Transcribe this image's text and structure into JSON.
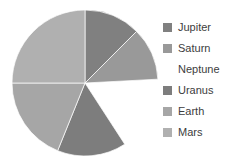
{
  "chart_data": {
    "type": "pie",
    "title": "",
    "categories": [
      "Jupiter",
      "Saturn",
      "Neptune",
      "Uranus",
      "Earth",
      "Mars"
    ],
    "values": [
      12.5,
      11.7,
      16.7,
      15.3,
      18.9,
      25.0
    ],
    "units": "percent",
    "start_angle_deg": 0,
    "direction": "clockwise",
    "exploded_slices": [
      "Neptune"
    ],
    "legend_position": "right",
    "grid": false,
    "xlabel": "",
    "ylabel": "",
    "slices": [
      {
        "label": "Jupiter",
        "value": 12.5,
        "sweep_deg": 45,
        "color": "#808080",
        "exploded": false
      },
      {
        "label": "Saturn",
        "value": 11.7,
        "sweep_deg": 42,
        "color": "#999999",
        "exploded": false
      },
      {
        "label": "Neptune",
        "value": 16.7,
        "sweep_deg": 60,
        "color": "#ffffff",
        "exploded": true
      },
      {
        "label": "Uranus",
        "value": 15.3,
        "sweep_deg": 55,
        "color": "#7d7d7d",
        "exploded": false
      },
      {
        "label": "Earth",
        "value": 18.9,
        "sweep_deg": 68,
        "color": "#a6a6a6",
        "exploded": false
      },
      {
        "label": "Mars",
        "value": 25.0,
        "sweep_deg": 90,
        "color": "#b0b0b0",
        "exploded": false
      }
    ]
  },
  "legend": {
    "items": [
      {
        "label": "Jupiter",
        "color": "#808080"
      },
      {
        "label": "Saturn",
        "color": "#999999"
      },
      {
        "label": "Neptune",
        "color": "#ffffff"
      },
      {
        "label": "Uranus",
        "color": "#7d7d7d"
      },
      {
        "label": "Earth",
        "color": "#a6a6a6"
      },
      {
        "label": "Mars",
        "color": "#b0b0b0"
      }
    ]
  },
  "style": {
    "background": "#ffffff",
    "text_color": "#3d3d3d",
    "slice_edge_color": "#ffffff"
  }
}
